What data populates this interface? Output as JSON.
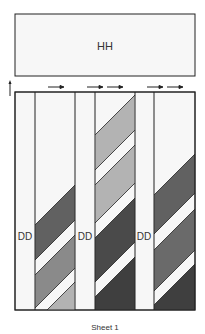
{
  "header_box": {
    "label": "HH"
  },
  "side_labels": [
    "DD",
    "DD",
    "DD"
  ],
  "caption": "Sheet 1",
  "colors": {
    "background": "#ffffff",
    "box_fill": "#f7f7f7",
    "stroke": "#222222",
    "light": "#b3b3b3",
    "medium": "#8a8a8a",
    "dark": "#616161",
    "darker": "#4a4a4a"
  },
  "stripe_columns": [
    {
      "name": "column-1",
      "bands": [
        "dark",
        "medium",
        "light"
      ]
    },
    {
      "name": "column-2",
      "bands": [
        "light",
        "light",
        "dark",
        "darker"
      ]
    },
    {
      "name": "column-3",
      "bands": [
        "dark",
        "medium",
        "darker"
      ]
    }
  ],
  "arrows": {
    "count": 5,
    "direction": "right"
  }
}
